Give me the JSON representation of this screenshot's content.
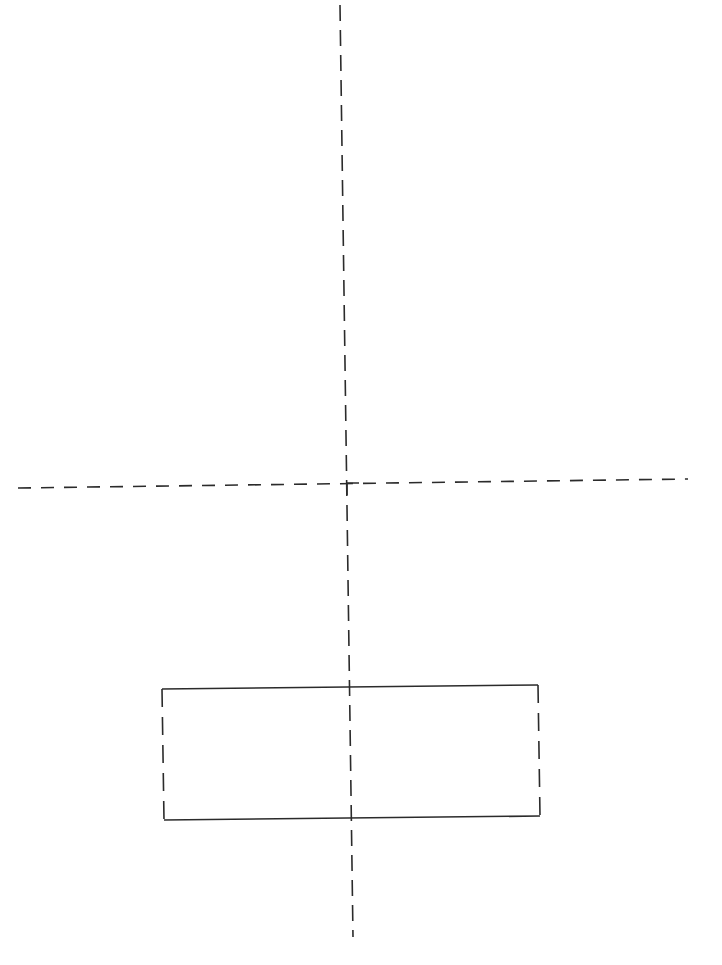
{
  "diagram": {
    "background": "#ffffff",
    "stroke_color": "#2b2b2b",
    "stroke_width": 1.6,
    "vertical_centerline": {
      "x1": 340,
      "y1": 5,
      "x2": 353,
      "y2": 937,
      "dash": "16 9"
    },
    "horizontal_line": {
      "x1": 18,
      "y1": 488,
      "x2": 688,
      "y2": 479,
      "dash": "13 10"
    },
    "rectangle": {
      "top_left": [
        162,
        689
      ],
      "top_right": [
        538,
        685
      ],
      "bottom_right": [
        540,
        816
      ],
      "bottom_left": [
        164,
        820
      ],
      "top_edge_style": "solid",
      "bottom_edge_style": "solid",
      "side_edge_style": "dashed",
      "side_dash": "18 10"
    },
    "corner_marker": {
      "x": 347,
      "y": 483,
      "description": "corner tick where vertical line meets horizontal line"
    }
  }
}
